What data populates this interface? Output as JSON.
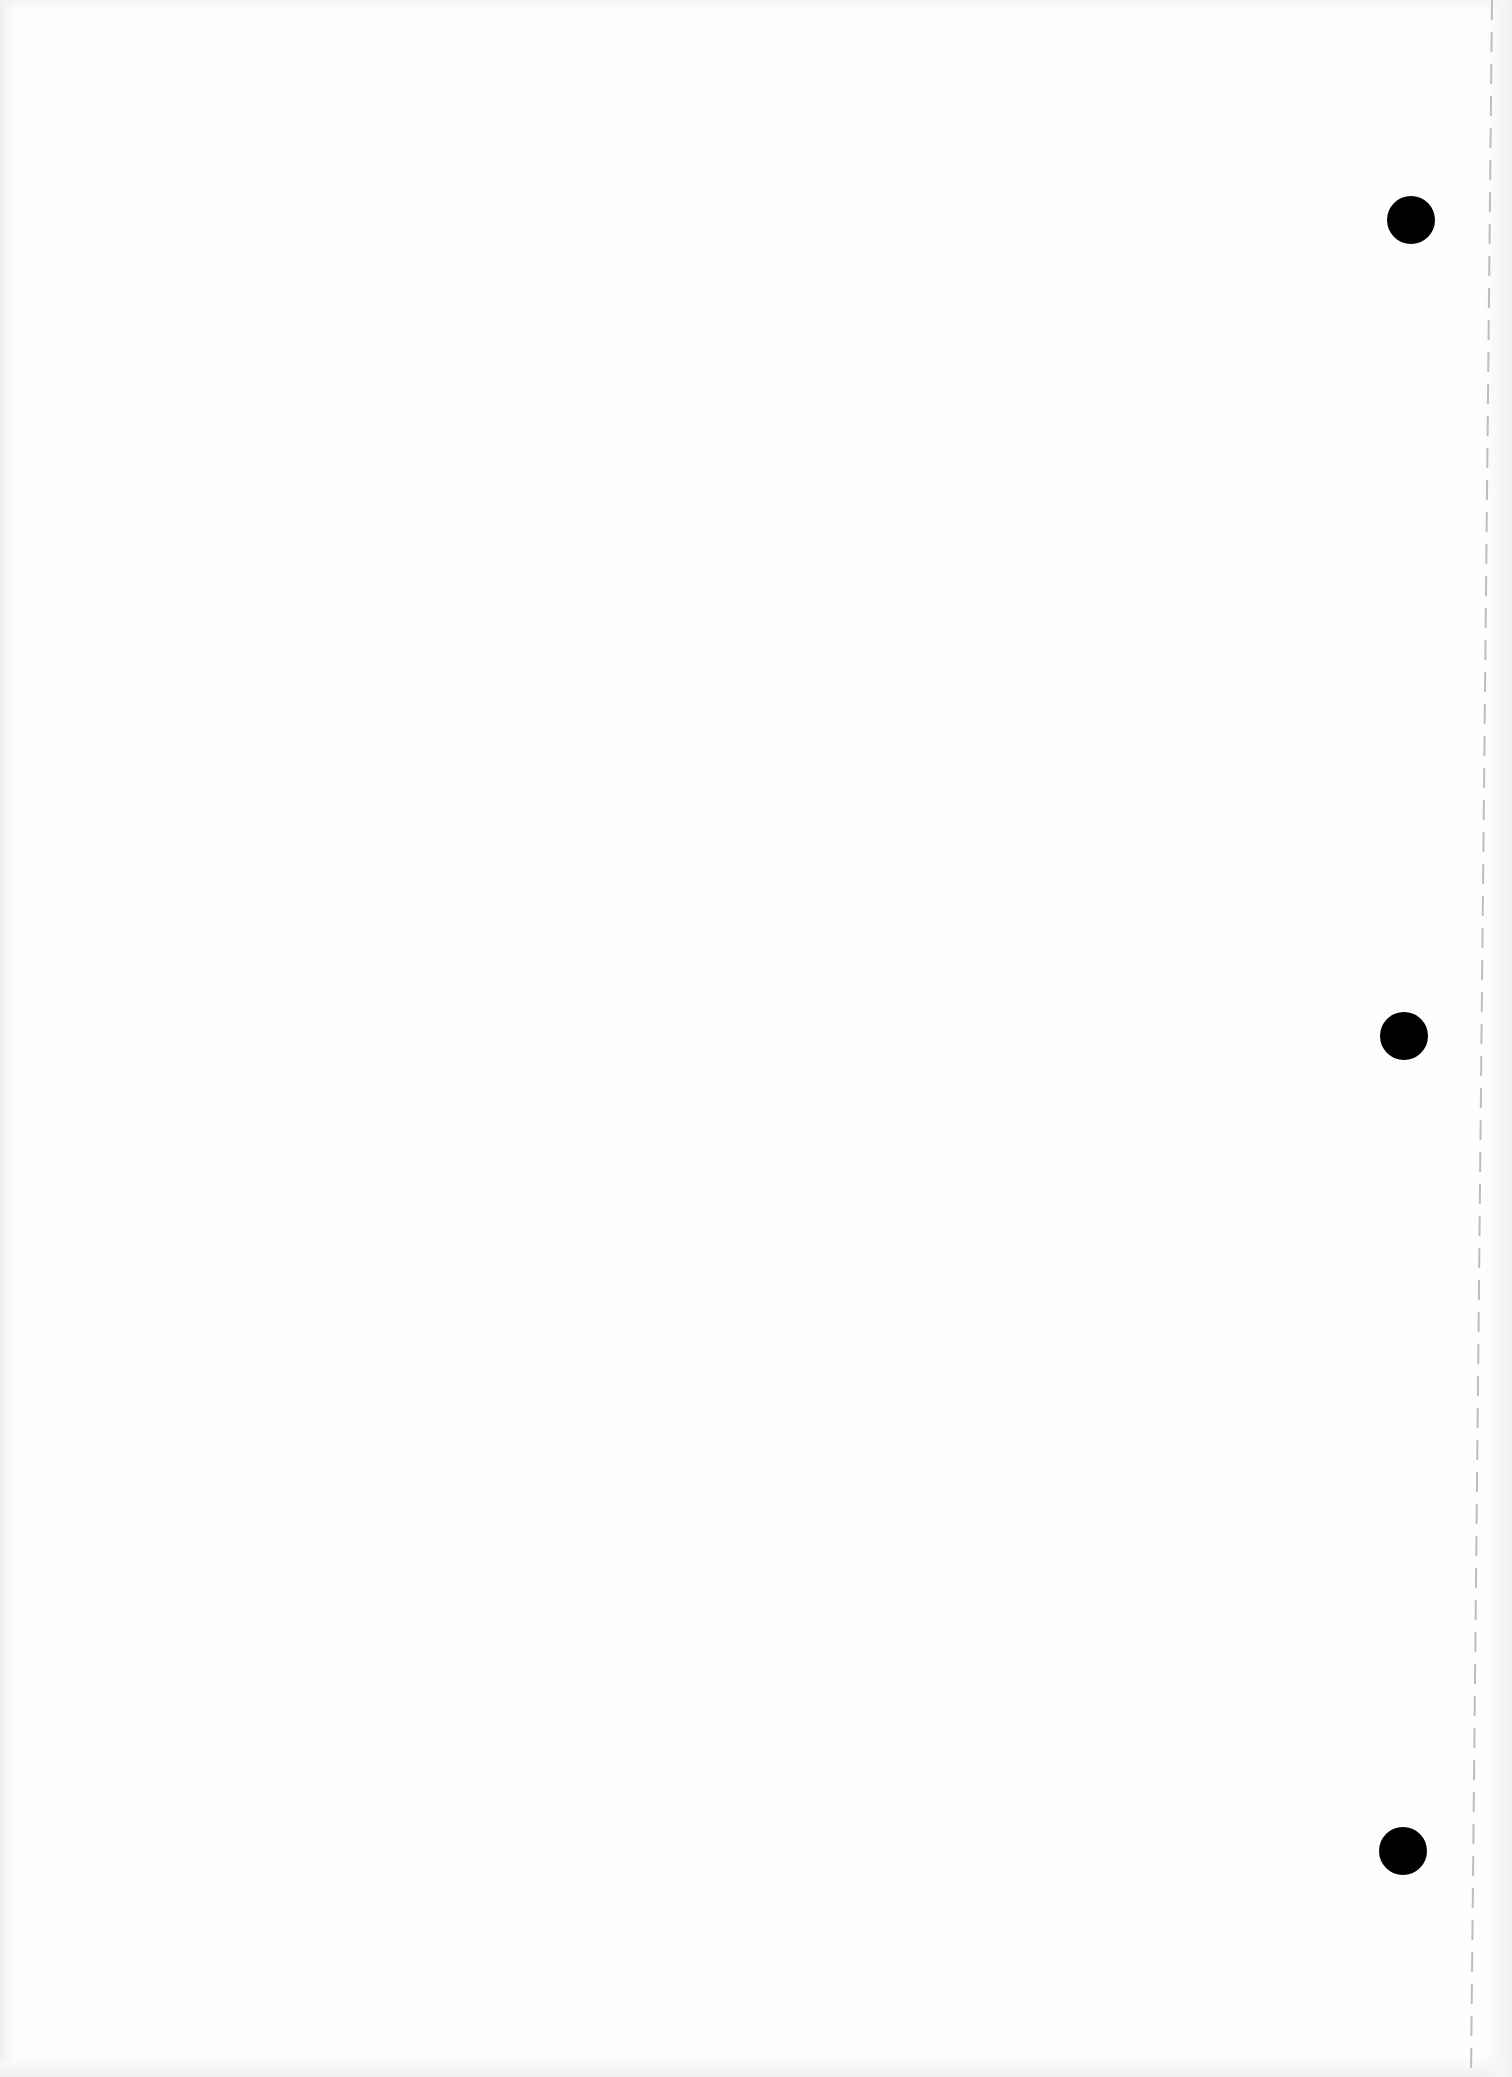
{
  "document": {
    "type": "scanned-blank-page",
    "background_color": "#fefefe",
    "text": ""
  },
  "punch_holes": [
    {
      "cx": 1411,
      "cy": 220,
      "r": 24,
      "color": "#000000"
    },
    {
      "cx": 1404,
      "cy": 1036,
      "r": 24,
      "color": "#000000"
    },
    {
      "cx": 1403,
      "cy": 1851,
      "r": 24,
      "color": "#000000"
    }
  ],
  "perforation_line": {
    "x_top": 1491,
    "x_bottom": 1470,
    "style": "dashed",
    "color": "#bdbdbd"
  }
}
